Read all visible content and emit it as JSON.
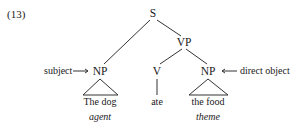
{
  "example_number": "(13)",
  "tree": {
    "root": {
      "label": "S"
    },
    "subject_np": {
      "label": "NP",
      "annotation": "subject",
      "arrow": "→",
      "text": "The dog",
      "role": "agent"
    },
    "vp": {
      "label": "VP",
      "verb": {
        "label": "V",
        "text": "ate"
      },
      "object_np": {
        "label": "NP",
        "annotation": "direct object",
        "arrow": "←",
        "text": "the food",
        "role": "theme"
      }
    }
  }
}
